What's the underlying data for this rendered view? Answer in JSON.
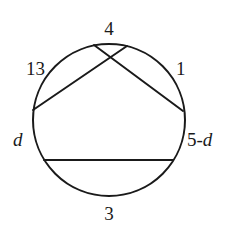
{
  "diagram": {
    "type": "circle-with-chords",
    "arc_labels": {
      "top": "4",
      "upper_left": "13",
      "upper_right": "1",
      "left": "d",
      "right": "5-d",
      "bottom": "3"
    },
    "chords": [
      {
        "name": "left-to-top-chord",
        "from": "left-point",
        "to": "top-right-point"
      },
      {
        "name": "top-left-to-right-chord",
        "from": "top-left-point",
        "to": "right-point"
      },
      {
        "name": "horizontal-chord",
        "from": "lower-left-point",
        "to": "lower-right-point"
      }
    ]
  }
}
